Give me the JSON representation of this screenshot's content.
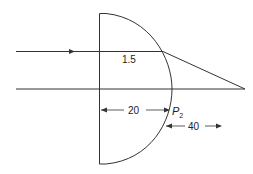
{
  "diagram": {
    "type": "plano-convex lens ray diagram",
    "refractive_index_label": "1.5",
    "dimension_1": {
      "value": "20"
    },
    "dimension_2": {
      "value": "40"
    },
    "point_label": {
      "main": "P",
      "sub": "2"
    },
    "colors": {
      "line": "#333333",
      "background": "#ffffff"
    }
  }
}
